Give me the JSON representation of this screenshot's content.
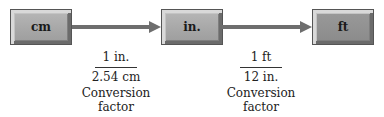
{
  "diagram": {
    "nodes": [
      {
        "id": "cm",
        "label": "cm"
      },
      {
        "id": "in",
        "label": "in."
      },
      {
        "id": "ft",
        "label": "ft"
      }
    ],
    "edges": [
      {
        "from": "cm",
        "to": "in",
        "numerator": "1 in.",
        "denominator": "2.54 cm",
        "caption_line1": "Conversion",
        "caption_line2": "factor"
      },
      {
        "from": "in",
        "to": "ft",
        "numerator": "1 ft",
        "denominator": "12 in.",
        "caption_line1": "Conversion",
        "caption_line2": "factor"
      }
    ]
  }
}
